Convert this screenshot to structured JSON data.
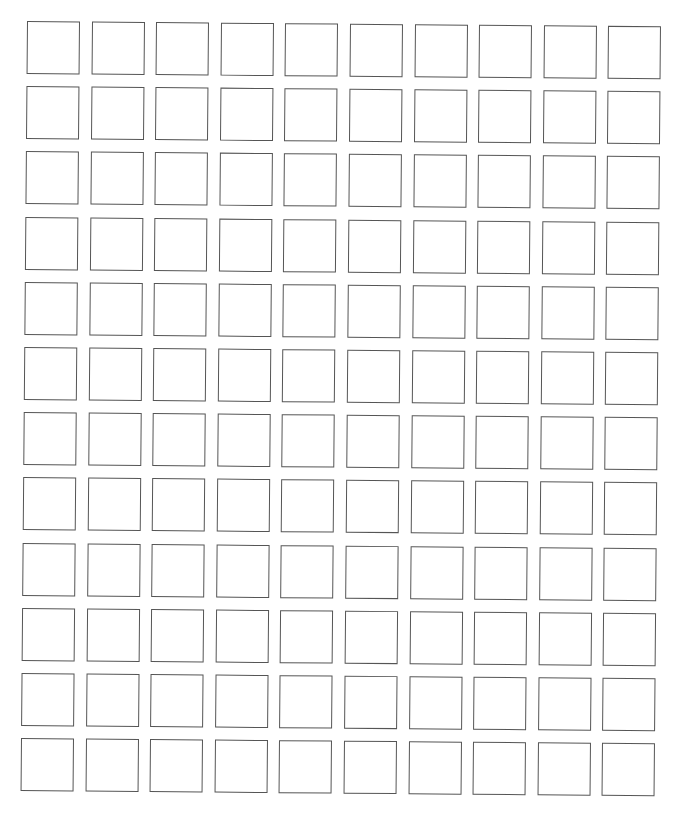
{
  "page": {
    "title_fragment": "",
    "background_color": "#ffffff"
  },
  "grid": {
    "rows": 12,
    "columns": 10,
    "cell_size_px": 53,
    "pitch_x_px": 64.6,
    "pitch_y_px": 65.2,
    "border_color": "#555555",
    "cells_filled": false
  }
}
